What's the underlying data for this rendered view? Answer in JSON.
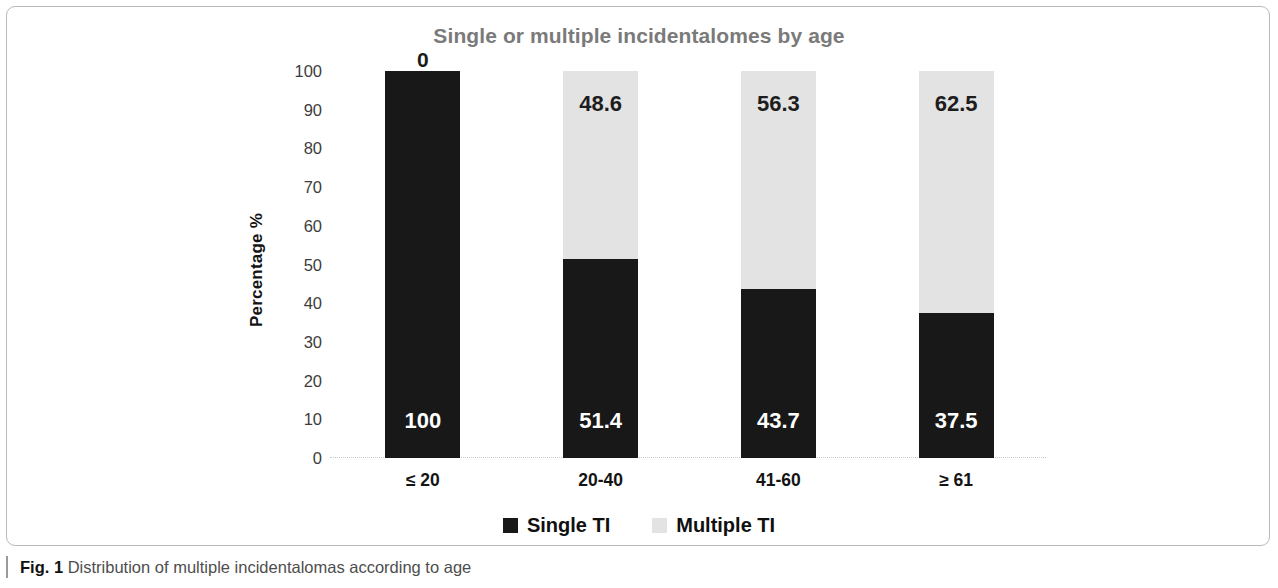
{
  "figure": {
    "caption_label": "Fig. 1",
    "caption_text": "Distribution of multiple incidentalomas according to age"
  },
  "colors": {
    "single": "#181818",
    "multiple": "#e3e3e3",
    "title": "#7a7a7a",
    "axis_text": "#141414",
    "frame": "#b9b9b9"
  },
  "chart_data": {
    "type": "bar",
    "stacked": true,
    "stacked_mode": "percent",
    "title": "Single or multiple incidentalomes by age",
    "xlabel": "",
    "ylabel": "Percentage %",
    "ylim": [
      0,
      100
    ],
    "yticks": [
      100,
      90,
      80,
      70,
      60,
      50,
      40,
      30,
      20,
      10,
      0
    ],
    "ytick_labels": [
      "100",
      "90",
      "80",
      "70",
      "60",
      "50",
      "40",
      "30",
      "20",
      "10",
      "0"
    ],
    "grid": false,
    "legend_position": "bottom",
    "categories": [
      "≤ 20",
      "20-40",
      "41-60",
      "≥ 61"
    ],
    "series": [
      {
        "name": "Single TI",
        "color": "#181818",
        "values": [
          100,
          51.4,
          43.7,
          37.5
        ],
        "labels": [
          "100",
          "51.4",
          "43.7",
          "37.5"
        ]
      },
      {
        "name": "Multiple TI",
        "color": "#e3e3e3",
        "values": [
          0,
          48.6,
          56.3,
          62.5
        ],
        "labels": [
          "0",
          "48.6",
          "56.3",
          "62.5"
        ]
      }
    ]
  }
}
